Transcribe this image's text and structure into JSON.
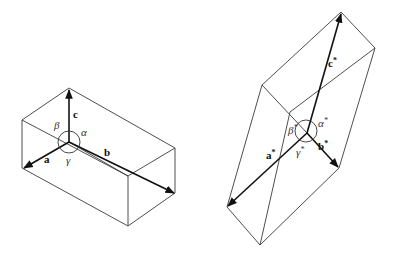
{
  "diagram": {
    "left": {
      "name": "direct-lattice-unit-cell",
      "vectors": {
        "a": "a",
        "b": "b",
        "c": "c"
      },
      "angles": {
        "alpha": "α",
        "beta": "β",
        "gamma": "γ"
      }
    },
    "right": {
      "name": "reciprocal-lattice-unit-cell",
      "vectors": {
        "a": "a",
        "b": "b",
        "c": "c",
        "star": "*"
      },
      "angles": {
        "alpha": "α",
        "beta": "β",
        "gamma": "γ",
        "star": "*"
      }
    }
  }
}
